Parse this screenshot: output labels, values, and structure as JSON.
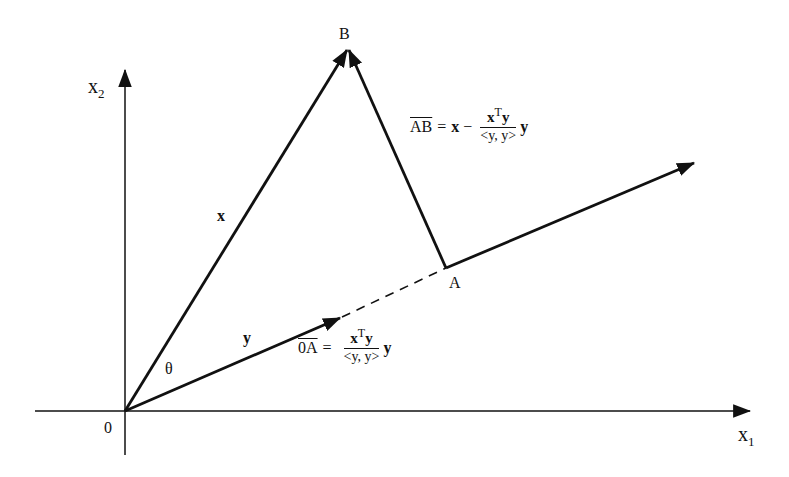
{
  "diagram": {
    "axes": {
      "x_label": "x",
      "x_subscript": "1",
      "y_label": "x",
      "y_subscript": "2",
      "origin_label": "0"
    },
    "points": {
      "B": "B",
      "A": "A"
    },
    "vectors": {
      "x_label": "x",
      "y_label": "y",
      "angle_label": "θ"
    },
    "equations": {
      "ab": {
        "lhs": "AB",
        "equals": "=",
        "x_term": "x",
        "minus": "−",
        "num_x": "x",
        "num_sup": "T",
        "num_y": "y",
        "den": "<y, y>",
        "trail": "y"
      },
      "oa": {
        "lhs": "0A",
        "equals": "=",
        "num_x": "x",
        "num_sup": "T",
        "num_y": "y",
        "den": "<y, y>",
        "trail": "y"
      }
    },
    "colors": {
      "ink": "#111111",
      "background": "#ffffff"
    }
  }
}
